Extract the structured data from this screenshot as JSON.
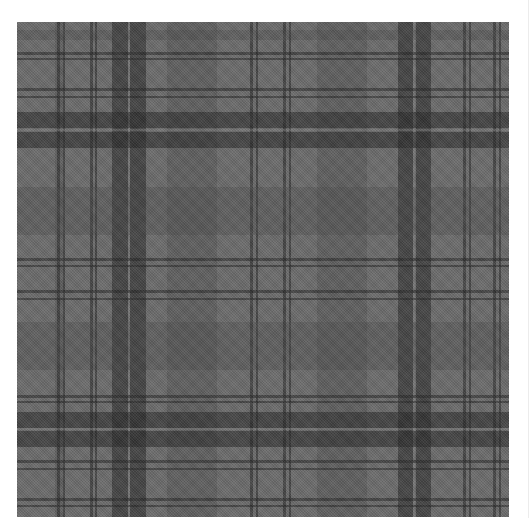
{
  "image": {
    "subject": "grayscale tartan plaid fabric pattern",
    "colors": {
      "background": "#ffffff",
      "base": "#6b6b6b",
      "dark": "#262626",
      "mid": "#474747",
      "light_line": "#8a8a8a"
    },
    "vertical_bands": [
      {
        "x": 38,
        "w": 8,
        "tone": "mid"
      },
      {
        "x": 40,
        "w": 3,
        "tone": "dark"
      },
      {
        "x": 46,
        "w": 2,
        "tone": "dark"
      },
      {
        "x": 73,
        "w": 3,
        "tone": "dark"
      },
      {
        "x": 78,
        "w": 2,
        "tone": "dark"
      },
      {
        "x": 95,
        "w": 16,
        "tone": "dark"
      },
      {
        "x": 113,
        "w": 16,
        "tone": "dark"
      },
      {
        "x": 111,
        "w": 2,
        "tone": "light_line"
      },
      {
        "x": 150,
        "w": 50,
        "tone": "mid"
      },
      {
        "x": 233,
        "w": 3,
        "tone": "dark"
      },
      {
        "x": 239,
        "w": 2,
        "tone": "dark"
      },
      {
        "x": 266,
        "w": 3,
        "tone": "dark"
      },
      {
        "x": 272,
        "w": 2,
        "tone": "dark"
      },
      {
        "x": 300,
        "w": 50,
        "tone": "mid"
      },
      {
        "x": 381,
        "w": 15,
        "tone": "dark"
      },
      {
        "x": 399,
        "w": 15,
        "tone": "dark"
      },
      {
        "x": 396,
        "w": 2,
        "tone": "light_line"
      },
      {
        "x": 446,
        "w": 3,
        "tone": "dark"
      },
      {
        "x": 452,
        "w": 2,
        "tone": "dark"
      },
      {
        "x": 476,
        "w": 3,
        "tone": "dark"
      },
      {
        "x": 482,
        "w": 2,
        "tone": "dark"
      }
    ],
    "horizontal_bands": [
      {
        "y": 8,
        "w": 10,
        "tone": "mid"
      },
      {
        "y": 30,
        "w": 3,
        "tone": "dark"
      },
      {
        "y": 36,
        "w": 2,
        "tone": "dark"
      },
      {
        "y": 66,
        "w": 3,
        "tone": "dark"
      },
      {
        "y": 74,
        "w": 2,
        "tone": "dark"
      },
      {
        "y": 90,
        "w": 16,
        "tone": "dark"
      },
      {
        "y": 110,
        "w": 16,
        "tone": "dark"
      },
      {
        "y": 107,
        "w": 2,
        "tone": "light_line"
      },
      {
        "y": 165,
        "w": 48,
        "tone": "mid"
      },
      {
        "y": 236,
        "w": 3,
        "tone": "dark"
      },
      {
        "y": 243,
        "w": 2,
        "tone": "dark"
      },
      {
        "y": 268,
        "w": 3,
        "tone": "dark"
      },
      {
        "y": 276,
        "w": 2,
        "tone": "dark"
      },
      {
        "y": 300,
        "w": 48,
        "tone": "mid"
      },
      {
        "y": 373,
        "w": 3,
        "tone": "dark"
      },
      {
        "y": 379,
        "w": 2,
        "tone": "dark"
      },
      {
        "y": 390,
        "w": 16,
        "tone": "dark"
      },
      {
        "y": 409,
        "w": 16,
        "tone": "dark"
      },
      {
        "y": 406,
        "w": 2,
        "tone": "light_line"
      },
      {
        "y": 438,
        "w": 3,
        "tone": "dark"
      },
      {
        "y": 446,
        "w": 2,
        "tone": "dark"
      },
      {
        "y": 476,
        "w": 3,
        "tone": "dark"
      },
      {
        "y": 483,
        "w": 2,
        "tone": "dark"
      }
    ]
  }
}
